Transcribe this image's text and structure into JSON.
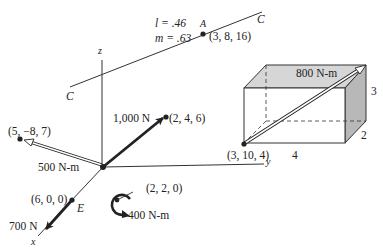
{
  "axes": {
    "x_label": "x",
    "y_label": "y",
    "z_label": "z"
  },
  "line_C": {
    "label_start": "C",
    "label_end": "C",
    "l_label": "l = .46",
    "m_label": "m = .63",
    "point_A": {
      "label": "A",
      "coords": "(3, 8, 16)"
    }
  },
  "forces": [
    {
      "name": "force-1000",
      "magnitude": "1,000 N",
      "point": "(2, 4, 6)"
    },
    {
      "name": "force-700",
      "magnitude": "700 N",
      "point_label": "E",
      "point": "(6, 0, 0)"
    }
  ],
  "moments": [
    {
      "name": "moment-500",
      "magnitude": "500 N-m",
      "point": "(5, −8, 7)"
    },
    {
      "name": "moment-400",
      "magnitude": "400 N-m",
      "point": "(2, 2, 0)"
    },
    {
      "name": "moment-800",
      "magnitude": "800 N-m",
      "point": "(3, 10, 4)"
    }
  ],
  "box": {
    "width_label": "4",
    "depth_label": "2",
    "height_label": "3"
  },
  "colors": {
    "ink": "#222222",
    "box_top": "#d6d6d6",
    "box_side": "#b8b8b8"
  }
}
